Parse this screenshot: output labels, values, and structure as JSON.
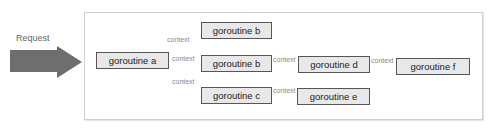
{
  "request": {
    "label": "Request",
    "arrow_color": "#6e6e6e"
  },
  "nodes": {
    "a": "goroutine a",
    "b1": "goroutine b",
    "b2": "goroutine b",
    "c": "goroutine c",
    "d": "goroutine d",
    "e": "goroutine e",
    "f": "goroutine f"
  },
  "edges": {
    "a_b1": "context",
    "a_b2": "context",
    "a_c": "context",
    "b2_d": "context",
    "c_e": "context",
    "d_f": "context"
  },
  "colors": {
    "node_fill": "#e8e8e8",
    "node_border": "#555555",
    "edge": "#b5b5b5",
    "frame_border": "#cfcfcf"
  }
}
